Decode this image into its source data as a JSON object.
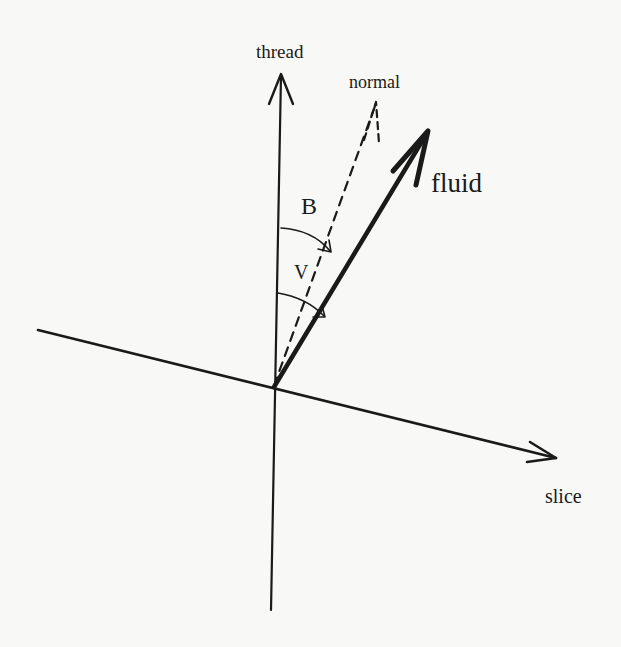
{
  "figure": {
    "type": "vector-diagram",
    "axes": {
      "vertical": {
        "label": "thread"
      },
      "horizontal": {
        "label": "slice"
      }
    },
    "vectors": [
      {
        "id": "normal",
        "label": "normal",
        "style": "dashed"
      },
      {
        "id": "fluid",
        "label": "fluid",
        "style": "thick-solid"
      }
    ],
    "angles": [
      {
        "id": "B",
        "label": "B",
        "from": "thread",
        "to": "normal"
      },
      {
        "id": "V",
        "label": "V",
        "from": "thread",
        "to": "fluid"
      }
    ],
    "colors": {
      "ink": "#1a1a1a",
      "paper": "#f8f8f6"
    }
  }
}
